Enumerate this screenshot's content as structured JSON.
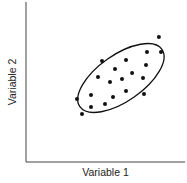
{
  "chart_data": {
    "type": "scatter",
    "title": "",
    "xlabel": "Variable 1",
    "ylabel": "Variable 2",
    "xlim": [
      0,
      100
    ],
    "ylim": [
      0,
      100
    ],
    "grid": false,
    "ticks": false,
    "legend": null,
    "series": [
      {
        "name": "observations",
        "points": [
          {
            "x": 83.6,
            "y": 78.1
          },
          {
            "x": 84.9,
            "y": 68.8
          },
          {
            "x": 76.1,
            "y": 68.8
          },
          {
            "x": 75.5,
            "y": 60.6
          },
          {
            "x": 47.8,
            "y": 63.1
          },
          {
            "x": 62.9,
            "y": 63.8
          },
          {
            "x": 56.0,
            "y": 58.1
          },
          {
            "x": 66.7,
            "y": 55.6
          },
          {
            "x": 45.3,
            "y": 53.1
          },
          {
            "x": 52.8,
            "y": 50.0
          },
          {
            "x": 60.4,
            "y": 51.9
          },
          {
            "x": 73.6,
            "y": 52.5
          },
          {
            "x": 40.9,
            "y": 41.9
          },
          {
            "x": 62.9,
            "y": 44.4
          },
          {
            "x": 74.2,
            "y": 42.5
          },
          {
            "x": 32.1,
            "y": 39.4
          },
          {
            "x": 54.7,
            "y": 40.6
          },
          {
            "x": 40.9,
            "y": 34.4
          },
          {
            "x": 49.7,
            "y": 36.3
          },
          {
            "x": 35.2,
            "y": 30.0
          }
        ]
      }
    ],
    "annotations": [
      {
        "type": "ellipse",
        "center": {
          "x": 59.7,
          "y": 52.5
        },
        "rx": 31.5,
        "ry": 14.5,
        "rotation_deg": 35,
        "description": "confidence ellipse enclosing the central cluster"
      }
    ]
  }
}
